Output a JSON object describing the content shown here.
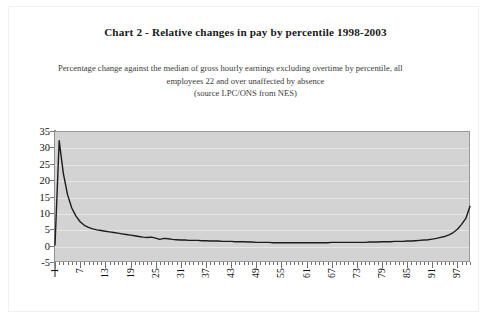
{
  "page": {
    "title": "Chart 2 - Relative changes in pay by percentile 1998-2003",
    "subtitle_lines": [
      "Percentage change against the median of gross hourly earnings excluding overtime by percentile, all",
      "employees 22 and over unaffected by absence",
      "(source LPC/ONS from NES)"
    ]
  },
  "chart_data": {
    "type": "line",
    "title": "Chart 2 - Relative changes in pay by percentile 1998-2003",
    "subtitle": "Percentage change against the median of gross hourly earnings excluding overtime by percentile, all employees 22 and over unaffected by absence (source LPC/ONS from NES)",
    "xlabel": "",
    "ylabel": "",
    "xlim": [
      1,
      100
    ],
    "ylim": [
      -5,
      35
    ],
    "ytick_labels": [
      "35",
      "30",
      "25",
      "20",
      "15",
      "10",
      "5",
      "0",
      "-5"
    ],
    "yticks": [
      35,
      30,
      25,
      20,
      15,
      10,
      5,
      0,
      -5
    ],
    "xtick_labels": [
      "1",
      "7",
      "13",
      "19",
      "25",
      "31",
      "37",
      "43",
      "49",
      "55",
      "61",
      "67",
      "73",
      "79",
      "85",
      "91",
      "97"
    ],
    "xticks": [
      1,
      7,
      13,
      19,
      25,
      31,
      37,
      43,
      49,
      55,
      61,
      67,
      73,
      79,
      85,
      91,
      97
    ],
    "grid": true,
    "legend": false,
    "line_color": "#1c1c1c",
    "plot_background": "#d3d3d3",
    "gridline_color": "#e6e6e6",
    "series": [
      {
        "name": "Relative change in pay",
        "x": [
          1,
          2,
          3,
          4,
          5,
          6,
          7,
          8,
          9,
          10,
          11,
          12,
          13,
          14,
          15,
          16,
          17,
          18,
          19,
          20,
          21,
          22,
          23,
          24,
          25,
          26,
          27,
          28,
          29,
          30,
          31,
          32,
          33,
          34,
          35,
          36,
          37,
          38,
          39,
          40,
          41,
          42,
          43,
          44,
          45,
          46,
          47,
          48,
          49,
          50,
          51,
          52,
          53,
          54,
          55,
          56,
          57,
          58,
          59,
          60,
          61,
          62,
          63,
          64,
          65,
          66,
          67,
          68,
          69,
          70,
          71,
          72,
          73,
          74,
          75,
          76,
          77,
          78,
          79,
          80,
          81,
          82,
          83,
          84,
          85,
          86,
          87,
          88,
          89,
          90,
          91,
          92,
          93,
          94,
          95,
          96,
          97,
          98,
          99,
          100
        ],
        "values": [
          0.2,
          32.0,
          22.0,
          15.5,
          11.5,
          9.0,
          7.3,
          6.2,
          5.6,
          5.1,
          4.8,
          4.6,
          4.4,
          4.2,
          4.0,
          3.8,
          3.6,
          3.4,
          3.2,
          3.0,
          2.8,
          2.6,
          2.5,
          2.6,
          2.3,
          1.9,
          2.2,
          2.1,
          1.9,
          1.8,
          1.7,
          1.7,
          1.6,
          1.6,
          1.6,
          1.5,
          1.5,
          1.4,
          1.4,
          1.4,
          1.3,
          1.3,
          1.3,
          1.2,
          1.2,
          1.2,
          1.1,
          1.1,
          1.0,
          1.0,
          1.0,
          1.0,
          0.9,
          0.9,
          0.9,
          0.9,
          0.9,
          0.9,
          0.9,
          0.9,
          0.9,
          0.9,
          0.9,
          0.9,
          0.9,
          0.9,
          1.0,
          1.0,
          1.0,
          1.0,
          1.0,
          1.0,
          1.0,
          1.0,
          1.0,
          1.1,
          1.1,
          1.1,
          1.2,
          1.2,
          1.2,
          1.3,
          1.3,
          1.3,
          1.4,
          1.4,
          1.5,
          1.6,
          1.7,
          1.8,
          2.0,
          2.2,
          2.5,
          2.8,
          3.3,
          4.0,
          5.0,
          6.5,
          8.3,
          12.0
        ]
      }
    ]
  }
}
